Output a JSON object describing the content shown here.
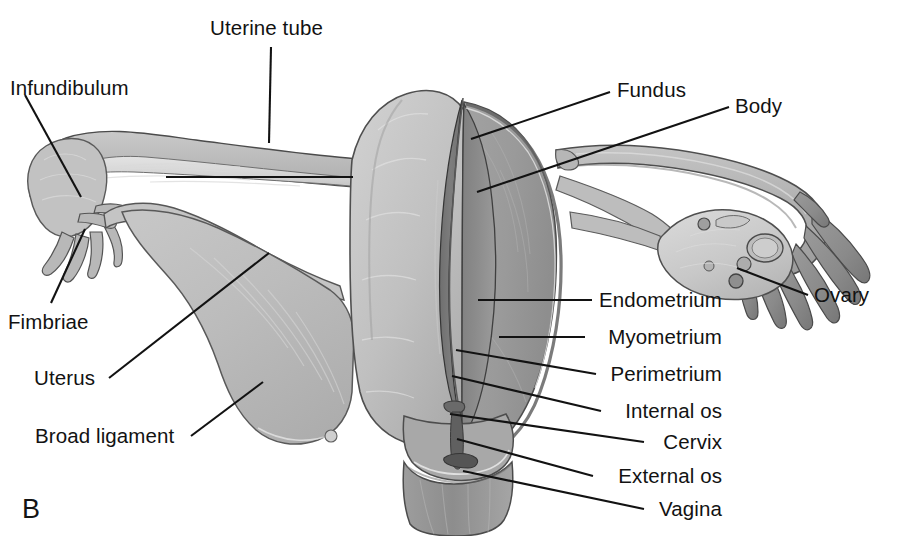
{
  "figure": {
    "panel_letter": "B",
    "background_color": "#ffffff",
    "ink_color": "#121212",
    "width": 910,
    "height": 536
  },
  "labels": [
    {
      "id": "uterine-tube",
      "text": "Uterine tube",
      "x": 210,
      "y": 18,
      "align": "left"
    },
    {
      "id": "infundibulum",
      "text": "Infundibulum",
      "x": 10,
      "y": 78,
      "align": "left"
    },
    {
      "id": "fundus",
      "text": "Fundus",
      "x": 617,
      "y": 80,
      "align": "left"
    },
    {
      "id": "body",
      "text": "Body",
      "x": 735,
      "y": 96,
      "align": "left"
    },
    {
      "id": "endometrium",
      "text": "Endometrium",
      "x": 722,
      "y": 292,
      "align": "right"
    },
    {
      "id": "myometrium",
      "text": "Myometrium",
      "x": 722,
      "y": 329,
      "align": "right"
    },
    {
      "id": "perimetrium",
      "text": "Perimetrium",
      "x": 722,
      "y": 366,
      "align": "right"
    },
    {
      "id": "internal-os",
      "text": "Internal os",
      "x": 722,
      "y": 403,
      "align": "right"
    },
    {
      "id": "cervix",
      "text": "Cervix",
      "x": 722,
      "y": 434,
      "align": "right"
    },
    {
      "id": "external-os",
      "text": "External os",
      "x": 722,
      "y": 468,
      "align": "right"
    },
    {
      "id": "vagina",
      "text": "Vagina",
      "x": 722,
      "y": 501,
      "align": "right"
    },
    {
      "id": "ovary",
      "text": "Ovary",
      "x": 814,
      "y": 287,
      "align": "left"
    },
    {
      "id": "fimbriae",
      "text": "Fimbriae",
      "x": 8,
      "y": 314,
      "align": "left"
    },
    {
      "id": "uterus",
      "text": "Uterus",
      "x": 34,
      "y": 370,
      "align": "left"
    },
    {
      "id": "broad-ligament",
      "text": "Broad ligament",
      "x": 35,
      "y": 428,
      "align": "left"
    }
  ],
  "leader_lines": [
    {
      "id": "uterine-tube-leader",
      "points": "272,44 272,44 269,140"
    },
    {
      "id": "infundibulum-leader",
      "points": "24,95 80,196"
    },
    {
      "id": "uterine-tube-lumen-bar",
      "points": "166,177 353,177"
    },
    {
      "id": "fundus-leader",
      "points": "610,92 472,139"
    },
    {
      "id": "body-leader",
      "points": "730,106 477,192"
    },
    {
      "id": "endometrium-leader",
      "points": "592,300 478,300"
    },
    {
      "id": "myometrium-leader",
      "points": "585,337 498,337"
    },
    {
      "id": "perimetrium-leader",
      "points": "595,374 456,350"
    },
    {
      "id": "internal-os-leader",
      "points": "600,411 452,375"
    },
    {
      "id": "cervix-leader",
      "points": "643,442 450,414"
    },
    {
      "id": "external-os-leader",
      "points": "592,476 456,438"
    },
    {
      "id": "vagina-leader",
      "points": "643,509 462,471"
    },
    {
      "id": "ovary-leader",
      "points": "808,295 736,268"
    },
    {
      "id": "fimbriae-leader",
      "points": "50,302 84,228"
    },
    {
      "id": "uterus-leader",
      "points": "108,378 268,253"
    },
    {
      "id": "broad-ligament-leader",
      "points": "190,436 262,382"
    }
  ]
}
